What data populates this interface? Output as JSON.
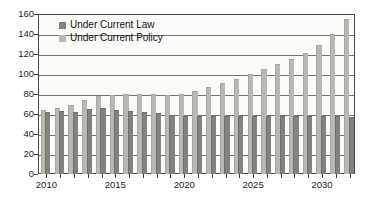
{
  "chart_data": {
    "type": "bar",
    "title": "",
    "subtitle": "",
    "xlabel": "",
    "ylabel": "",
    "xlim": [
      2009.5,
      2032.5
    ],
    "ylim": [
      0,
      160
    ],
    "ytick_step": 20,
    "yticks": [
      0,
      20,
      40,
      60,
      80,
      100,
      120,
      140,
      160
    ],
    "ytick_labels": [
      "0",
      "20",
      "40",
      "60",
      "80",
      "100",
      "120",
      "140",
      "160"
    ],
    "grid": true,
    "grid_axis": "y",
    "legend_position": "top-left-inside",
    "categories": [
      2010,
      2011,
      2012,
      2013,
      2014,
      2015,
      2016,
      2017,
      2018,
      2019,
      2020,
      2021,
      2022,
      2023,
      2024,
      2025,
      2026,
      2027,
      2028,
      2029,
      2030,
      2031,
      2032
    ],
    "xtick_labels": [
      "2010",
      "2015",
      "2020",
      "2025",
      "2030"
    ],
    "xtick_label_values": [
      2010,
      2015,
      2020,
      2025,
      2030
    ],
    "series": [
      {
        "name": "Under Current Law",
        "color": "#83837c",
        "values": [
          62,
          63,
          62,
          65,
          66,
          64,
          63,
          62,
          61,
          59,
          58,
          58,
          58,
          58,
          58,
          58,
          58,
          58,
          58,
          58,
          58,
          58,
          57
        ]
      },
      {
        "name": "Under Current Policy",
        "color": "#b9b9b2",
        "values": [
          64,
          66,
          69,
          74,
          78,
          79,
          80,
          80,
          80,
          79,
          80,
          83,
          87,
          91,
          95,
          100,
          105,
          110,
          115,
          121,
          129,
          140,
          155
        ]
      }
    ]
  },
  "legend": {
    "items": [
      {
        "label": "Under Current Law",
        "swatch": "law"
      },
      {
        "label": "Under Current Policy",
        "swatch": "policy"
      }
    ]
  }
}
